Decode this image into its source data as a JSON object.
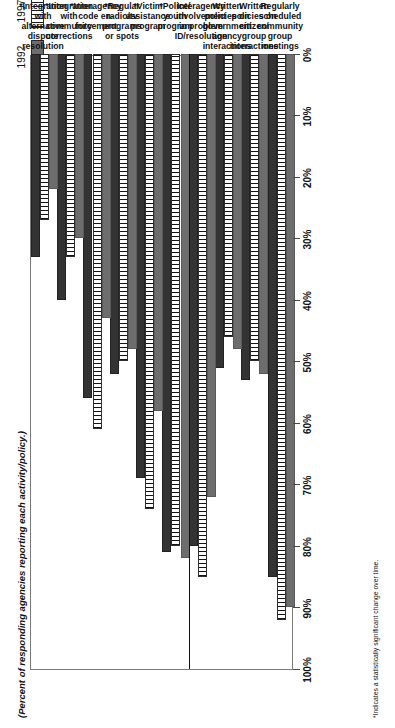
{
  "legend": {
    "items": [
      {
        "label": "1992",
        "swatch": "gray-solid",
        "color": "#6d6d6d"
      },
      {
        "label": "1997",
        "swatch": "white-vertical-stripes",
        "color": "#ffffff"
      },
      {
        "label": "2002",
        "swatch": "dark-solid",
        "color": "#333333"
      }
    ]
  },
  "axis_title": "(Percent of responding agencies reporting each activity/policy.)",
  "footnote": "*Indicates a statistically significant change over time.",
  "chart_data": {
    "type": "bar",
    "orientation": "horizontal",
    "title": "",
    "subtitle": "",
    "xlabel": "(Percent of responding agencies reporting each activity/policy.)",
    "ylabel": "",
    "xlim": [
      0,
      100
    ],
    "grid": false,
    "legend_position": "top-left",
    "tick_labels": [
      "0%",
      "10%",
      "20%",
      "30%",
      "40%",
      "50%",
      "60%",
      "70%",
      "80%",
      "90%",
      "100%"
    ],
    "tick_values": [
      0,
      10,
      20,
      30,
      40,
      50,
      60,
      70,
      80,
      90,
      100
    ],
    "categories": [
      "Regularly scheduled community group meetings",
      "Written policies on citizen/group interactions",
      "Written policies on government agency interactions",
      "Interagency involvement in problem ID/resolution",
      "*Police/youth program",
      "*Victim assistance program",
      "*Regular radio/tv programs or spots",
      "*Interagency code enforcement",
      "*Integration with community corrections",
      "*Integration with alternative dispute resolution"
    ],
    "category_lines": [
      [
        "Regularly",
        "scheduled",
        "community",
        "group",
        "meetings"
      ],
      [
        "Written",
        "policies on",
        "citizen/",
        "group",
        "interactions"
      ],
      [
        "Written",
        "policies on",
        "government",
        "agency",
        "interactions"
      ],
      [
        "Interagency",
        "involvement",
        "in problem",
        "ID/resolution"
      ],
      [
        "*Police/",
        "youth",
        "program"
      ],
      [
        "*Victim",
        "assistance",
        "program"
      ],
      [
        "*Regular",
        "radio/tv",
        "programs",
        "or spots"
      ],
      [
        "*Interagency",
        "code en-",
        "forcement"
      ],
      [
        "*Integration",
        "with",
        "community",
        "corrections"
      ],
      [
        "*Integration",
        "with",
        "alternative",
        "dispute",
        "resolution"
      ]
    ],
    "series": [
      {
        "name": "1992",
        "values": [
          90,
          52,
          48,
          72,
          82,
          58,
          48,
          43,
          30,
          22
        ]
      },
      {
        "name": "1997",
        "values": [
          92,
          50,
          46,
          85,
          80,
          74,
          50,
          61,
          33,
          27
        ]
      },
      {
        "name": "2002",
        "values": [
          85,
          53,
          51,
          80,
          81,
          69,
          52,
          56,
          40,
          33
        ]
      }
    ]
  }
}
